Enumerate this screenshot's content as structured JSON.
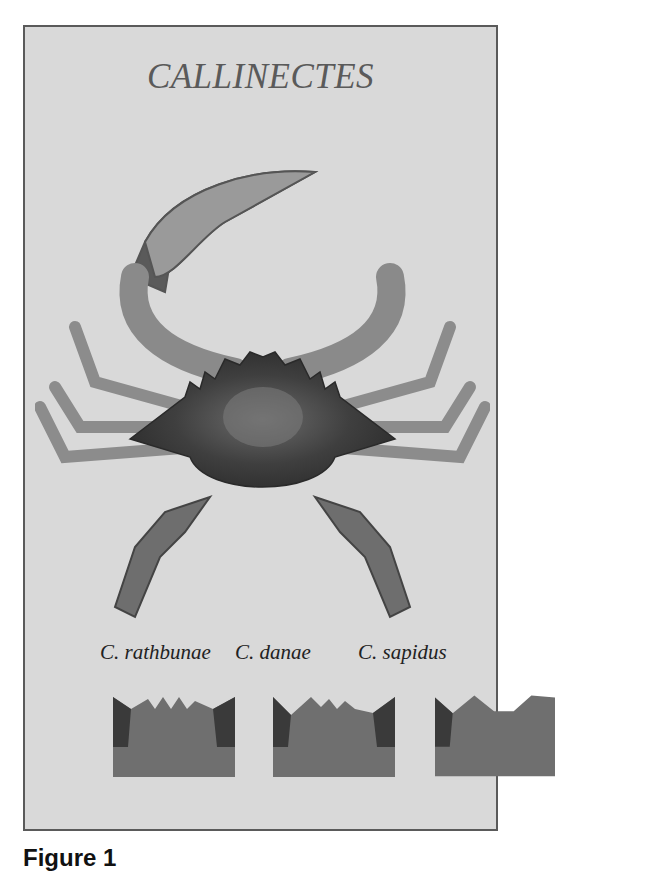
{
  "figure": {
    "title": "CALLINECTES",
    "species": [
      {
        "label": "C. rathbunae"
      },
      {
        "label": "C. danae"
      },
      {
        "label": "C. sapidus"
      }
    ],
    "caption": "Figure 1"
  },
  "colors": {
    "background": "#d9d9d9",
    "border": "#5a5a5a",
    "title": "#5a5a5a",
    "crab_dark": "#3a3a3a",
    "crab_light": "#a8a8a8"
  }
}
